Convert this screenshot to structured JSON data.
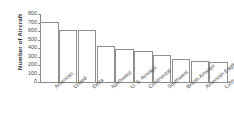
{
  "chart_data": {
    "type": "bar",
    "title": "",
    "xlabel": "",
    "ylabel": "Number of Aircraft",
    "ylim": [
      0,
      800
    ],
    "ytick_step": 100,
    "grid": false,
    "legend": "none",
    "bar_style": {
      "fill": "#ffffff",
      "edge": "#8e8e8e"
    },
    "categories": [
      "American",
      "United",
      "Delta",
      "Northwest",
      "U. S. Airways",
      "Continental",
      "Southwest",
      "British Airways",
      "American Eagle",
      "Lufthansa (Ger.)"
    ],
    "values": [
      710,
      615,
      615,
      425,
      390,
      370,
      320,
      275,
      245,
      230
    ],
    "ytick_labels": [
      "0",
      "100",
      "200",
      "300",
      "400",
      "500",
      "600",
      "700",
      "800"
    ],
    "ytick_values": [
      0,
      100,
      200,
      300,
      400,
      500,
      600,
      700,
      800
    ]
  },
  "axis": {
    "y_title": "Number of Aircraft"
  }
}
